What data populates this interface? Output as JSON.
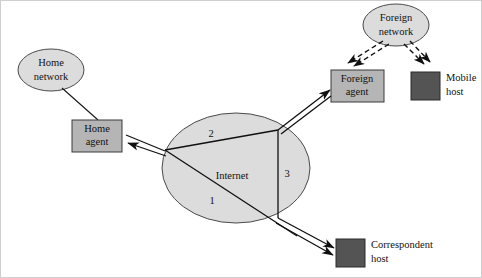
{
  "diagram": {
    "background_color": "#ffffff",
    "nodes": {
      "home_network": {
        "label_line1": "Home",
        "label_line2": "network",
        "shape": "ellipse",
        "fill": "#dcdcdc"
      },
      "foreign_network": {
        "label_line1": "Foreign",
        "label_line2": "network",
        "shape": "ellipse",
        "fill": "#dcdcdc"
      },
      "internet": {
        "label": "Internet",
        "shape": "ellipse",
        "fill": "#dcdcdc"
      },
      "home_agent": {
        "label_line1": "Home",
        "label_line2": "agent",
        "shape": "box",
        "fill": "#b5b5b5"
      },
      "foreign_agent": {
        "label_line1": "Foreign",
        "label_line2": "agent",
        "shape": "box",
        "fill": "#b5b5b5"
      },
      "mobile_host": {
        "label_line1": "Mobile",
        "label_line2": "host",
        "shape": "box",
        "fill": "#545454"
      },
      "correspondent_host": {
        "label_line1": "Correspondent",
        "label_line2": "host",
        "shape": "box",
        "fill": "#545454"
      }
    },
    "path_labels": {
      "one": "1",
      "two": "2",
      "three": "3"
    },
    "edges": [
      {
        "name": "home-network-to-home-agent",
        "style": "solid-thin",
        "arrow": "none"
      },
      {
        "name": "internet-to-home-agent",
        "style": "double-line",
        "arrow": "to-home-agent"
      },
      {
        "name": "internet-to-foreign-agent",
        "style": "double-line",
        "arrow": "to-foreign-agent"
      },
      {
        "name": "internet-to-correspondent-host",
        "style": "double-line",
        "arrow": "to-correspondent-host"
      },
      {
        "name": "foreign-network-to-foreign-agent",
        "style": "dashed",
        "arrow": "to-foreign-agent"
      },
      {
        "name": "foreign-network-to-mobile-host",
        "style": "dashed",
        "arrow": "to-mobile-host"
      }
    ]
  }
}
